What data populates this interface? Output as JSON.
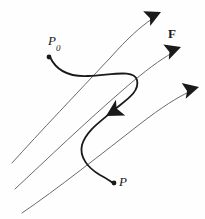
{
  "figure": {
    "background_color": "#fefefe",
    "labels": {
      "start_point": "P",
      "start_point_subscript": "0",
      "end_point": "P",
      "field": "F"
    },
    "colors": {
      "field_line": "#6b6b6b",
      "trajectory": "#1a1a1a",
      "arrow_fill": "#1a1a1a",
      "point_marker": "#1a1a1a",
      "label_text": "#1a1a1a"
    },
    "strokes": {
      "field_line_width": "1",
      "trajectory_width": "1.8"
    },
    "field_lines": [
      {
        "name": "field-line-top",
        "path": "M 12 163 C 40 132, 78 92, 110 58 C 128 38, 140 27, 152 19",
        "arrow_tip": [
          160,
          13
        ],
        "arrow_angle": -36
      },
      {
        "name": "field-line-middle",
        "path": "M 15 189 C 46 160, 88 120, 124 89 C 146 70, 160 60, 172 53",
        "arrow_tip": [
          180,
          48
        ],
        "arrow_angle": -30
      },
      {
        "name": "field-line-bottom",
        "path": "M 22 213 C 56 190, 104 152, 140 124 C 162 107, 178 97, 189 92",
        "arrow_tip": [
          198,
          88
        ],
        "arrow_angle": -25
      }
    ],
    "trajectory": {
      "name": "trajectory-curve",
      "path": "M 50 57 C 56 70, 68 77, 88 76 C 112 75, 134 69, 137 80 C 140 92, 126 100, 114 110 C 100 122, 86 131, 82 145 C 79 157, 88 168, 100 175 C 106 178, 110 181, 113 183",
      "start_marker": [
        49,
        57
      ],
      "end_marker": [
        114,
        183
      ],
      "arrow_tip": [
        106,
        116
      ],
      "arrow_angle": 140
    }
  }
}
